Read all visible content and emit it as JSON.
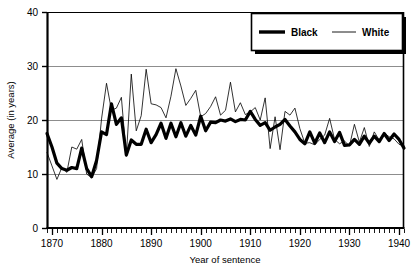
{
  "chart_data": {
    "type": "line",
    "title": "",
    "subtitle": "",
    "xlabel": "Year of sentence",
    "ylabel": "Average (in years)",
    "xlim": [
      1869,
      1941
    ],
    "ylim": [
      0,
      40
    ],
    "xticks": [
      1870,
      1880,
      1890,
      1900,
      1910,
      1920,
      1930,
      1940
    ],
    "xtick_labels": [
      "1870",
      "1880",
      "1890",
      "1900",
      "1910",
      "1920",
      "1930",
      "1940"
    ],
    "yticks": [
      0,
      10,
      20,
      30,
      40
    ],
    "ytick_labels": [
      "0",
      "10",
      "20",
      "30",
      "40"
    ],
    "minor_xtick_interval": 1,
    "grid": "horizontal",
    "grid_color": "#808080",
    "legend_position": "top-right",
    "legend_entries": [
      {
        "name": "Black",
        "style": "thick",
        "color": "#000000",
        "width": 3.2
      },
      {
        "name": "White",
        "style": "thin",
        "color": "#000000",
        "width": 0.8
      }
    ],
    "x": [
      1869,
      1870,
      1871,
      1872,
      1873,
      1874,
      1875,
      1876,
      1877,
      1878,
      1879,
      1880,
      1881,
      1882,
      1883,
      1884,
      1885,
      1886,
      1887,
      1888,
      1889,
      1890,
      1891,
      1892,
      1893,
      1894,
      1895,
      1896,
      1897,
      1898,
      1899,
      1900,
      1901,
      1902,
      1903,
      1904,
      1905,
      1906,
      1907,
      1908,
      1909,
      1910,
      1911,
      1912,
      1913,
      1914,
      1915,
      1916,
      1917,
      1918,
      1919,
      1920,
      1921,
      1922,
      1923,
      1924,
      1925,
      1926,
      1927,
      1928,
      1929,
      1930,
      1931,
      1932,
      1933,
      1934,
      1935,
      1936,
      1937,
      1938,
      1939,
      1940,
      1941
    ],
    "series": [
      {
        "name": "Black",
        "color": "#000000",
        "width": 3.2,
        "values": [
          17.5,
          15.0,
          12.0,
          11.0,
          10.7,
          11.2,
          11.0,
          14.8,
          11.0,
          9.5,
          12.5,
          17.8,
          17.3,
          23.0,
          19.2,
          20.4,
          13.5,
          16.3,
          15.5,
          15.5,
          18.3,
          15.8,
          17.3,
          19.4,
          16.6,
          19.4,
          16.9,
          19.5,
          17.0,
          19.0,
          17.2,
          20.7,
          18.0,
          19.6,
          19.5,
          20.0,
          19.8,
          20.2,
          19.7,
          20.1,
          20.0,
          21.6,
          20.1,
          19.0,
          19.5,
          18.1,
          18.7,
          19.2,
          20.1,
          18.9,
          17.8,
          16.4,
          15.6,
          17.8,
          15.7,
          17.6,
          15.8,
          17.8,
          16.0,
          17.7,
          15.3,
          15.4,
          16.4,
          15.5,
          17.0,
          15.7,
          17.0,
          16.0,
          17.5,
          16.2,
          17.4,
          16.4,
          14.8
        ]
      },
      {
        "name": "White",
        "color": "#000000",
        "width": 0.8,
        "values": [
          14.0,
          11.5,
          9.0,
          11.2,
          10.3,
          15.0,
          14.6,
          16.4,
          10.0,
          9.3,
          11.0,
          20.2,
          26.8,
          21.8,
          22.2,
          24.2,
          13.3,
          28.5,
          18.0,
          20.8,
          29.4,
          23.0,
          22.8,
          22.3,
          20.4,
          24.4,
          29.5,
          26.3,
          22.7,
          24.0,
          25.5,
          20.6,
          21.2,
          22.5,
          24.3,
          20.9,
          21.8,
          27.0,
          21.5,
          23.2,
          21.0,
          21.5,
          22.3,
          20.0,
          24.1,
          14.7,
          20.6,
          14.5,
          21.6,
          20.9,
          22.2,
          18.4,
          15.7,
          15.8,
          15.4,
          16.4,
          17.2,
          20.3,
          16.4,
          15.6,
          16.1,
          15.2,
          19.2,
          15.9,
          18.6,
          15.1,
          17.8,
          16.3,
          17.6,
          16.9,
          16.5,
          15.5,
          15.2
        ]
      }
    ]
  },
  "plot": {
    "left": 47,
    "top": 12,
    "right": 404,
    "bottom": 228
  }
}
